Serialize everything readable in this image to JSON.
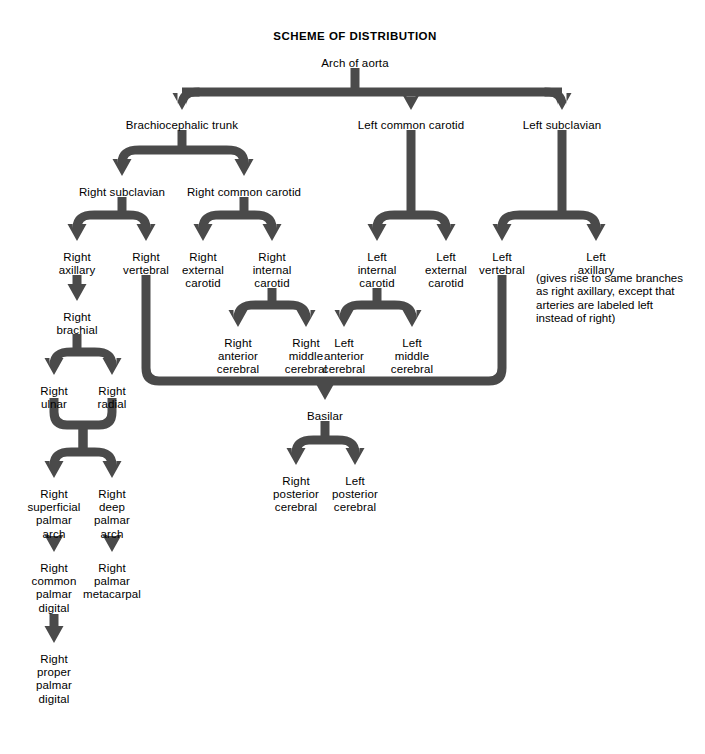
{
  "document": {
    "title": "SCHEME OF DISTRIBUTION",
    "title_x": 355,
    "title_y": 30
  },
  "style": {
    "arrow_fill": "#4a4a4a",
    "arrow_highlight": "#6e6e6e",
    "text_color": "#000000",
    "background": "#ffffff",
    "stroke_width": 9
  },
  "note": {
    "text": "(gives rise to same branches\nas right axillary, except that\narteries are labeled left\ninstead of right)",
    "x": 536,
    "y": 272
  },
  "nodes": [
    {
      "id": "arch_of_aorta",
      "label": "Arch of aorta",
      "x": 355,
      "y": 57
    },
    {
      "id": "brachiocephalic_trunk",
      "label": "Brachiocephalic trunk",
      "x": 182,
      "y": 119
    },
    {
      "id": "left_common_carotid",
      "label": "Left common carotid",
      "x": 411,
      "y": 119
    },
    {
      "id": "left_subclavian",
      "label": "Left subclavian",
      "x": 562,
      "y": 119
    },
    {
      "id": "right_subclavian",
      "label": "Right subclavian",
      "x": 122,
      "y": 186
    },
    {
      "id": "right_common_carotid",
      "label": "Right common carotid",
      "x": 244,
      "y": 186
    },
    {
      "id": "right_axillary",
      "label": "Right\naxillary",
      "x": 77,
      "y": 251
    },
    {
      "id": "right_vertebral",
      "label": "Right\nvertebral",
      "x": 146,
      "y": 251
    },
    {
      "id": "right_external_carotid",
      "label": "Right\nexternal\ncarotid",
      "x": 203,
      "y": 251
    },
    {
      "id": "right_internal_carotid",
      "label": "Right\ninternal\ncarotid",
      "x": 272,
      "y": 251
    },
    {
      "id": "left_internal_carotid",
      "label": "Left\ninternal\ncarotid",
      "x": 377,
      "y": 251
    },
    {
      "id": "left_external_carotid",
      "label": "Left\nexternal\ncarotid",
      "x": 446,
      "y": 251
    },
    {
      "id": "left_vertebral",
      "label": "Left\nvertebral",
      "x": 502,
      "y": 251
    },
    {
      "id": "left_axillary",
      "label": "Left\naxillary",
      "x": 596,
      "y": 251
    },
    {
      "id": "right_brachial",
      "label": "Right\nbrachial",
      "x": 77,
      "y": 311
    },
    {
      "id": "right_anterior_cerebral",
      "label": "Right\nanterior\ncerebral",
      "x": 238,
      "y": 337
    },
    {
      "id": "right_middle_cerebral",
      "label": "Right\nmiddle\ncerebral",
      "x": 306,
      "y": 337
    },
    {
      "id": "left_anterior_cerebral",
      "label": "Left\nanterior\ncerebral",
      "x": 344,
      "y": 337
    },
    {
      "id": "left_middle_cerebral",
      "label": "Left\nmiddle\ncerebral",
      "x": 412,
      "y": 337
    },
    {
      "id": "right_ulnar",
      "label": "Right\nulnar",
      "x": 54,
      "y": 385
    },
    {
      "id": "right_radial",
      "label": "Right\nradial",
      "x": 112,
      "y": 385
    },
    {
      "id": "basilar",
      "label": "Basilar",
      "x": 325,
      "y": 410
    },
    {
      "id": "right_superficial_palmar_arch",
      "label": "Right\nsuperficial\npalmar\narch",
      "x": 54,
      "y": 488
    },
    {
      "id": "right_deep_palmar_arch",
      "label": "Right\ndeep\npalmar\narch",
      "x": 112,
      "y": 488
    },
    {
      "id": "right_posterior_cerebral",
      "label": "Right\nposterior\ncerebral",
      "x": 296,
      "y": 475
    },
    {
      "id": "left_posterior_cerebral",
      "label": "Left\nposterior\ncerebral",
      "x": 355,
      "y": 475
    },
    {
      "id": "right_common_palmar_digital",
      "label": "Right\ncommon\npalmar\ndigital",
      "x": 54,
      "y": 562
    },
    {
      "id": "right_palmar_metacarpal",
      "label": "Right\npalmar\nmetacarpal",
      "x": 112,
      "y": 562
    },
    {
      "id": "right_proper_palmar_digital",
      "label": "Right\nproper\npalmar\ndigital",
      "x": 54,
      "y": 653
    }
  ],
  "connectors": [
    {
      "id": "aorta-trunk",
      "type": "stem",
      "x": 355,
      "y1": 68,
      "y2": 88
    },
    {
      "id": "aorta-bus",
      "type": "bus",
      "y": 92,
      "x_left": 182,
      "x_right": 562,
      "drops": [
        182,
        411,
        562
      ],
      "drop_to": 110
    },
    {
      "id": "trunk-split",
      "type": "split",
      "x": 182,
      "y_top": 130,
      "y_bar": 150,
      "y_end": 176,
      "x_left": 122,
      "x_right": 244
    },
    {
      "id": "rsub-split",
      "type": "split",
      "x": 122,
      "y_top": 197,
      "y_bar": 215,
      "y_end": 241,
      "x_left": 77,
      "x_right": 146
    },
    {
      "id": "rcc-split",
      "type": "split",
      "x": 244,
      "y_top": 197,
      "y_bar": 215,
      "y_end": 241,
      "x_left": 203,
      "x_right": 272
    },
    {
      "id": "lcc-stem-split",
      "type": "split",
      "x": 411,
      "y_top": 130,
      "y_bar": 215,
      "y_end": 241,
      "x_left": 377,
      "x_right": 446
    },
    {
      "id": "lsub-split",
      "type": "split",
      "x": 562,
      "y_top": 130,
      "y_bar": 215,
      "y_end": 241,
      "x_left": 502,
      "x_right": 596
    },
    {
      "id": "raxil-brachial",
      "type": "arrow",
      "x": 77,
      "y1": 275,
      "y2": 301
    },
    {
      "id": "ric-split",
      "type": "split",
      "x": 272,
      "y_top": 288,
      "y_bar": 305,
      "y_end": 327,
      "x_left": 238,
      "x_right": 306
    },
    {
      "id": "lic-split",
      "type": "split",
      "x": 377,
      "y_top": 288,
      "y_bar": 305,
      "y_end": 327,
      "x_left": 344,
      "x_right": 412
    },
    {
      "id": "brachial-split",
      "type": "split",
      "x": 77,
      "y_top": 334,
      "y_bar": 352,
      "y_end": 375,
      "x_left": 54,
      "x_right": 112
    },
    {
      "id": "right-vert-path",
      "type": "elbow",
      "x": 146,
      "y1": 275,
      "y2": 381,
      "x_end": 325,
      "dir": "right"
    },
    {
      "id": "left-vert-path",
      "type": "elbow",
      "x": 502,
      "y1": 275,
      "y2": 381,
      "x_end": 325,
      "dir": "left"
    },
    {
      "id": "basilar-arrow",
      "type": "arrow",
      "x": 325,
      "y1": 381,
      "y2": 400
    },
    {
      "id": "basilar-split",
      "type": "split",
      "x": 325,
      "y_top": 421,
      "y_bar": 440,
      "y_end": 465,
      "x_left": 296,
      "x_right": 355
    },
    {
      "id": "ulnar-radial-merge",
      "type": "merge_split",
      "x_left_in": 54,
      "x_right_in": 112,
      "y_top": 398,
      "y_merge": 425,
      "y_mid": 440,
      "y_bar": 452,
      "y_end": 478,
      "x_center": 83,
      "x_left_out": 54,
      "x_right_out": 112
    },
    {
      "id": "sup-arch-common",
      "type": "arrow",
      "x": 54,
      "y1": 536,
      "y2": 552
    },
    {
      "id": "deep-arch-metacarpal",
      "type": "arrow",
      "x": 112,
      "y1": 536,
      "y2": 552
    },
    {
      "id": "common-proper",
      "type": "arrow",
      "x": 54,
      "y1": 614,
      "y2": 643
    }
  ]
}
